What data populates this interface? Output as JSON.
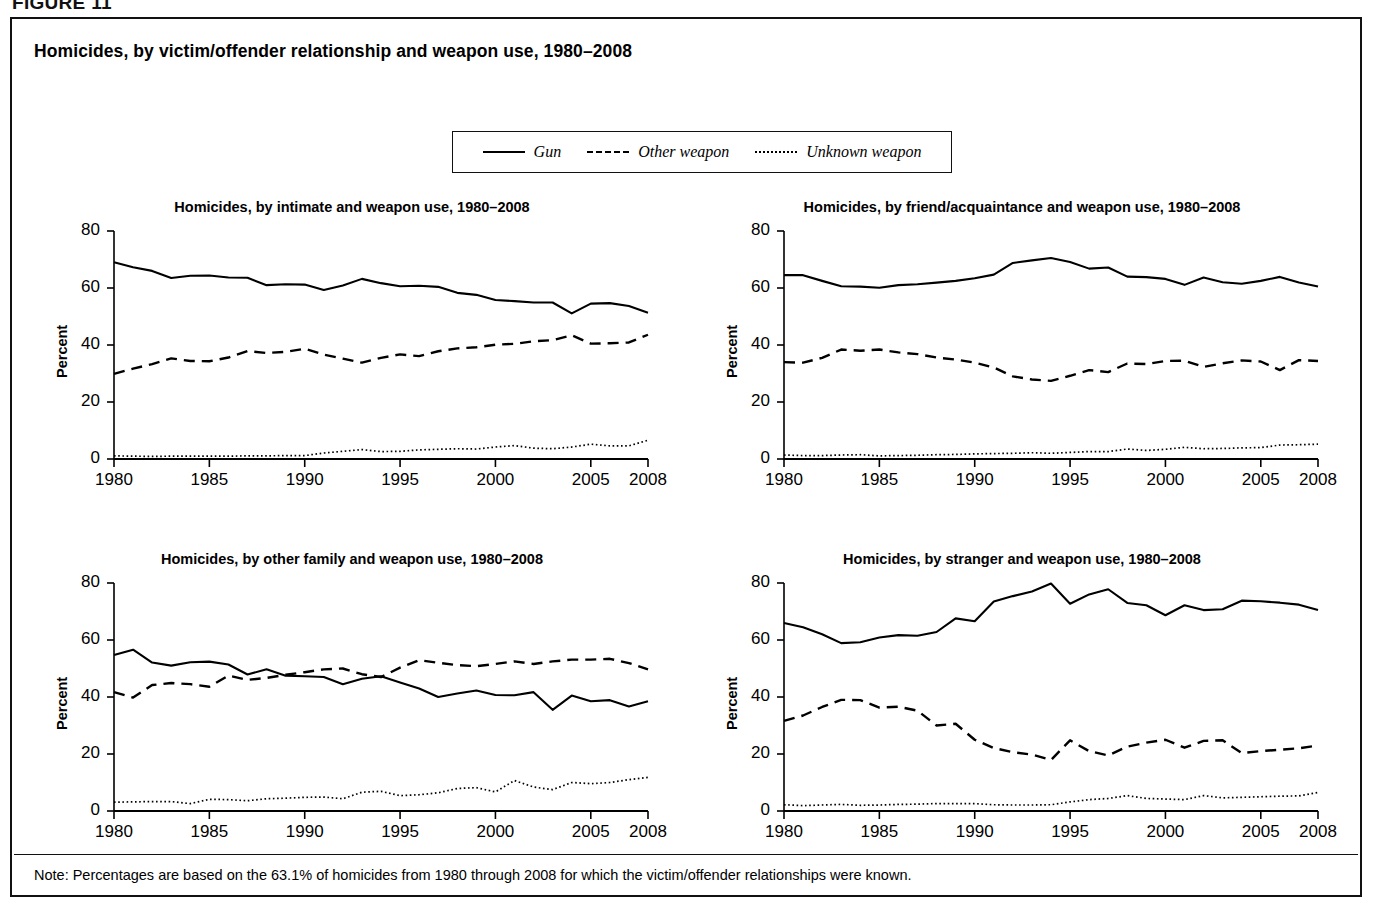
{
  "figure_label": "FIGURE 11",
  "panel": {
    "title": "Homicides, by victim/offender relationship and weapon use, 1980–2008",
    "note": "Note: Percentages are based on the 63.1% of homicides from 1980 through 2008 for which the victim/offender relationships were known."
  },
  "legend": {
    "items": [
      {
        "label": "Gun",
        "style": "solid"
      },
      {
        "label": "Other weapon",
        "style": "dashed"
      },
      {
        "label": "Unknown weapon",
        "style": "dotted"
      }
    ]
  },
  "axis": {
    "ylabel": "Percent",
    "yticks": [
      "0",
      "20",
      "40",
      "60",
      "80"
    ],
    "xticks": [
      "1980",
      "1985",
      "1990",
      "1995",
      "2000",
      "2005",
      "2008"
    ],
    "ylim": [
      0,
      80
    ],
    "xlim": [
      1980,
      2008
    ]
  },
  "chart_data": [
    {
      "type": "line",
      "id": "intimate",
      "title": "Homicides, by intimate and weapon use, 1980–2008",
      "xlabel": "",
      "ylabel": "Percent",
      "ylim": [
        0,
        80
      ],
      "xlim": [
        1980,
        2008
      ],
      "grid": false,
      "legend_position": "top-shared",
      "x": [
        1980,
        1981,
        1982,
        1983,
        1984,
        1985,
        1986,
        1987,
        1988,
        1989,
        1990,
        1991,
        1992,
        1993,
        1994,
        1995,
        1996,
        1997,
        1998,
        1999,
        2000,
        2001,
        2002,
        2003,
        2004,
        2005,
        2006,
        2007,
        2008
      ],
      "series": [
        {
          "name": "Gun",
          "style": "solid",
          "values": [
            69.0,
            67.3,
            66.0,
            63.5,
            64.3,
            64.4,
            63.7,
            63.6,
            61.0,
            61.3,
            61.2,
            59.3,
            60.9,
            63.2,
            61.7,
            60.6,
            60.8,
            60.4,
            58.3,
            57.6,
            55.8,
            55.4,
            54.9,
            54.9,
            51.1,
            54.5,
            54.7,
            53.7,
            51.3
          ]
        },
        {
          "name": "Other weapon",
          "style": "dashed",
          "values": [
            29.9,
            31.7,
            33.3,
            35.3,
            34.4,
            34.3,
            35.6,
            37.9,
            37.2,
            37.6,
            38.7,
            36.6,
            35.2,
            33.8,
            35.5,
            36.7,
            36.1,
            37.8,
            38.8,
            39.2,
            40.1,
            40.4,
            41.3,
            41.7,
            43.4,
            40.5,
            40.6,
            40.9,
            43.6
          ]
        },
        {
          "name": "Unknown weapon",
          "style": "dotted",
          "values": [
            1.1,
            1.0,
            0.9,
            1.0,
            1.0,
            1.0,
            1.0,
            1.1,
            1.1,
            1.2,
            1.2,
            2.1,
            2.7,
            3.3,
            2.6,
            2.7,
            3.2,
            3.4,
            3.6,
            3.5,
            4.2,
            4.7,
            3.8,
            3.6,
            4.2,
            5.2,
            4.6,
            4.6,
            6.6
          ]
        }
      ]
    },
    {
      "type": "line",
      "id": "friend-acquaintance",
      "title": "Homicides, by friend/acquaintance and weapon use, 1980–2008",
      "xlabel": "",
      "ylabel": "Percent",
      "ylim": [
        0,
        80
      ],
      "xlim": [
        1980,
        2008
      ],
      "grid": false,
      "legend_position": "top-shared",
      "x": [
        1980,
        1981,
        1982,
        1983,
        1984,
        1985,
        1986,
        1987,
        1988,
        1989,
        1990,
        1991,
        1992,
        1993,
        1994,
        1995,
        1996,
        1997,
        1998,
        1999,
        2000,
        2001,
        2002,
        2003,
        2004,
        2005,
        2006,
        2007,
        2008
      ],
      "series": [
        {
          "name": "Gun",
          "style": "solid",
          "values": [
            64.5,
            64.5,
            62.5,
            60.6,
            60.5,
            60.1,
            61.0,
            61.3,
            61.9,
            62.5,
            63.4,
            64.7,
            68.8,
            69.7,
            70.5,
            69.1,
            66.8,
            67.2,
            64.0,
            63.8,
            63.2,
            61.1,
            63.7,
            62.0,
            61.5,
            62.5,
            63.9,
            61.9,
            60.5
          ]
        },
        {
          "name": "Other weapon",
          "style": "dashed",
          "values": [
            34.0,
            33.8,
            35.5,
            38.4,
            38.0,
            38.4,
            37.4,
            36.8,
            35.6,
            34.9,
            33.8,
            32.1,
            29.0,
            27.9,
            27.4,
            29.2,
            31.2,
            30.5,
            33.5,
            33.3,
            34.4,
            34.5,
            32.3,
            33.6,
            34.6,
            34.2,
            31.2,
            34.7,
            34.4
          ]
        },
        {
          "name": "Unknown weapon",
          "style": "dotted",
          "values": [
            1.4,
            1.2,
            1.2,
            1.4,
            1.5,
            1.1,
            1.2,
            1.3,
            1.5,
            1.6,
            1.8,
            1.9,
            2.0,
            2.2,
            2.0,
            2.3,
            2.6,
            2.6,
            3.5,
            3.0,
            3.4,
            4.1,
            3.6,
            3.7,
            3.9,
            4.0,
            4.9,
            5.0,
            5.2
          ]
        }
      ]
    },
    {
      "type": "line",
      "id": "other-family",
      "title": "Homicides, by other family and weapon use, 1980–2008",
      "xlabel": "",
      "ylabel": "Percent",
      "ylim": [
        0,
        80
      ],
      "xlim": [
        1980,
        2008
      ],
      "grid": false,
      "legend_position": "top-shared",
      "x": [
        1980,
        1981,
        1982,
        1983,
        1984,
        1985,
        1986,
        1987,
        1988,
        1989,
        1990,
        1991,
        1992,
        1993,
        1994,
        1995,
        1996,
        1997,
        1998,
        1999,
        2000,
        2001,
        2002,
        2003,
        2004,
        2005,
        2006,
        2007,
        2008
      ],
      "series": [
        {
          "name": "Gun",
          "style": "solid",
          "values": [
            54.7,
            56.6,
            52.1,
            51.0,
            52.2,
            52.4,
            51.4,
            47.9,
            49.7,
            47.5,
            47.3,
            47.0,
            44.5,
            46.4,
            47.3,
            45.1,
            43.0,
            40.0,
            41.2,
            42.3,
            40.7,
            40.6,
            41.7,
            35.5,
            40.5,
            38.5,
            38.9,
            36.7,
            38.5
          ]
        },
        {
          "name": "Other weapon",
          "style": "dashed",
          "values": [
            41.7,
            39.8,
            44.2,
            44.9,
            44.5,
            43.6,
            47.5,
            46.0,
            46.7,
            47.8,
            48.7,
            49.7,
            50.0,
            48.0,
            47.0,
            50.3,
            52.9,
            52.0,
            51.2,
            50.8,
            51.6,
            52.5,
            51.6,
            52.5,
            53.1,
            53.1,
            53.4,
            51.9,
            49.7
          ]
        },
        {
          "name": "Unknown weapon",
          "style": "dotted",
          "values": [
            3.1,
            3.2,
            3.3,
            3.3,
            2.6,
            4.1,
            4.0,
            3.6,
            4.3,
            4.5,
            4.8,
            4.9,
            4.3,
            6.6,
            6.9,
            5.4,
            5.7,
            6.4,
            7.9,
            8.2,
            6.7,
            10.7,
            8.4,
            7.5,
            10.0,
            9.6,
            10.0,
            11.0,
            11.8
          ]
        }
      ]
    },
    {
      "type": "line",
      "id": "stranger",
      "title": "Homicides, by stranger and weapon use, 1980–2008",
      "xlabel": "",
      "ylabel": "Percent",
      "ylim": [
        0,
        80
      ],
      "xlim": [
        1980,
        2008
      ],
      "grid": false,
      "legend_position": "top-shared",
      "x": [
        1980,
        1981,
        1982,
        1983,
        1984,
        1985,
        1986,
        1987,
        1988,
        1989,
        1990,
        1991,
        1992,
        1993,
        1994,
        1995,
        1996,
        1997,
        1998,
        1999,
        2000,
        2001,
        2002,
        2003,
        2004,
        2005,
        2006,
        2007,
        2008
      ],
      "series": [
        {
          "name": "Gun",
          "style": "solid",
          "values": [
            66.0,
            64.5,
            62.0,
            58.9,
            59.2,
            60.9,
            61.7,
            61.5,
            62.8,
            67.6,
            66.6,
            73.5,
            75.4,
            77.0,
            79.8,
            72.7,
            76.0,
            77.8,
            73.0,
            72.2,
            68.7,
            72.2,
            70.5,
            70.8,
            73.8,
            73.6,
            73.1,
            72.4,
            70.5
          ]
        },
        {
          "name": "Other weapon",
          "style": "dashed",
          "values": [
            31.6,
            33.5,
            36.5,
            39.0,
            38.9,
            36.3,
            36.6,
            35.2,
            30.0,
            30.6,
            25.0,
            22.1,
            20.6,
            19.8,
            17.9,
            24.8,
            21.0,
            19.5,
            22.6,
            24.0,
            25.0,
            22.2,
            24.6,
            24.8,
            20.3,
            21.0,
            21.5,
            22.0,
            23.0
          ]
        },
        {
          "name": "Unknown weapon",
          "style": "dotted",
          "values": [
            2.2,
            1.9,
            2.1,
            2.3,
            2.0,
            2.1,
            2.3,
            2.4,
            2.6,
            2.6,
            2.6,
            2.2,
            2.1,
            2.1,
            2.2,
            3.2,
            4.0,
            4.4,
            5.4,
            4.4,
            4.2,
            4.0,
            5.4,
            4.6,
            4.8,
            5.0,
            5.2,
            5.3,
            6.5
          ]
        }
      ]
    }
  ]
}
